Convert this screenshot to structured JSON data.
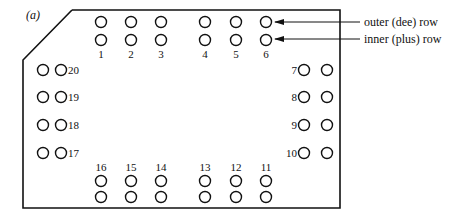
{
  "figure_label": "(a)",
  "annotations": {
    "outer_row": "outer (dee) row",
    "inner_row": "inner (plus) row"
  },
  "colors": {
    "stroke": "#111111",
    "background": "#ffffff"
  },
  "pins": {
    "top": [
      {
        "n": "1",
        "x": 101
      },
      {
        "n": "2",
        "x": 131
      },
      {
        "n": "3",
        "x": 161
      },
      {
        "n": "4",
        "x": 205
      },
      {
        "n": "5",
        "x": 236
      },
      {
        "n": "6",
        "x": 266
      }
    ],
    "bottom": [
      {
        "n": "16",
        "x": 101
      },
      {
        "n": "15",
        "x": 131
      },
      {
        "n": "14",
        "x": 161
      },
      {
        "n": "13",
        "x": 205
      },
      {
        "n": "12",
        "x": 236
      },
      {
        "n": "11",
        "x": 266
      }
    ],
    "left": [
      {
        "n": "20",
        "y": 70
      },
      {
        "n": "19",
        "y": 97
      },
      {
        "n": "18",
        "y": 125
      },
      {
        "n": "17",
        "y": 153
      }
    ],
    "right": [
      {
        "n": "7",
        "y": 70
      },
      {
        "n": "8",
        "y": 97
      },
      {
        "n": "9",
        "y": 125
      },
      {
        "n": "10",
        "y": 153
      }
    ]
  }
}
